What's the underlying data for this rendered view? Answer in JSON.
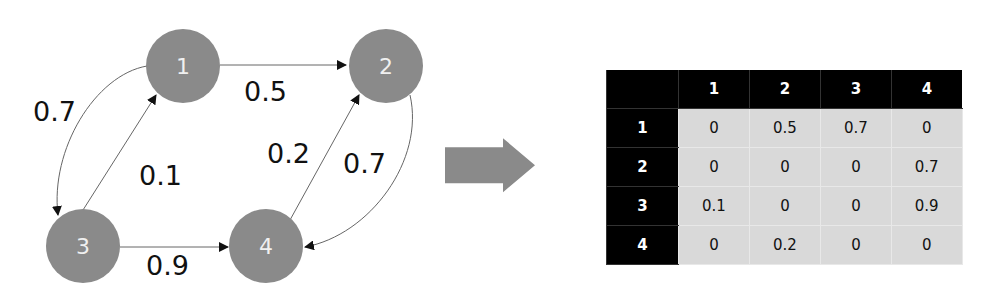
{
  "graph": {
    "nodes": [
      {
        "id": "1",
        "label": "1"
      },
      {
        "id": "2",
        "label": "2"
      },
      {
        "id": "3",
        "label": "3"
      },
      {
        "id": "4",
        "label": "4"
      }
    ],
    "edges": [
      {
        "from": "1",
        "to": "2",
        "weight": "0.5"
      },
      {
        "from": "1",
        "to": "3",
        "weight": "0.7"
      },
      {
        "from": "3",
        "to": "1",
        "weight": "0.1"
      },
      {
        "from": "3",
        "to": "4",
        "weight": "0.9"
      },
      {
        "from": "4",
        "to": "2",
        "weight": "0.2"
      },
      {
        "from": "2",
        "to": "4",
        "weight": "0.7"
      }
    ],
    "colors": {
      "node": "#8a8a8a",
      "node_text": "#f0f0f0",
      "edge": "#555555"
    }
  },
  "arrow": {
    "icon": "right-arrow-icon",
    "color": "#8a8a8a"
  },
  "matrix": {
    "corner": "",
    "col_headers": [
      "1",
      "2",
      "3",
      "4"
    ],
    "rows": [
      {
        "header": "1",
        "cells": [
          "0",
          "0.5",
          "0.7",
          "0"
        ]
      },
      {
        "header": "2",
        "cells": [
          "0",
          "0",
          "0",
          "0.7"
        ]
      },
      {
        "header": "3",
        "cells": [
          "0.1",
          "0",
          "0",
          "0.9"
        ]
      },
      {
        "header": "4",
        "cells": [
          "0",
          "0.2",
          "0",
          "0"
        ]
      }
    ],
    "colors": {
      "header_bg": "#000000",
      "header_text": "#ffffff",
      "cell_bg": "#d9d9d9"
    }
  }
}
